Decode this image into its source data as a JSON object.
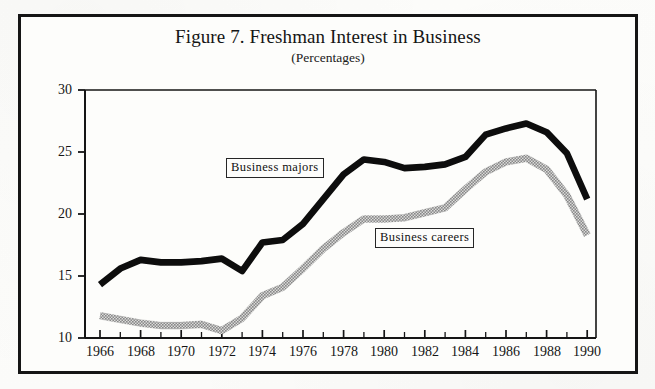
{
  "figure": {
    "title": "Figure 7. Freshman Interest in Business",
    "subtitle": "(Percentages)"
  },
  "labels": {
    "majors": "Business  majors",
    "careers": "Business  careers"
  },
  "colors": {
    "frame": "#151515",
    "axis": "#151515",
    "majors_line": "#0d0d0d",
    "careers_line": "#8a8a8a",
    "paper": "#fdfdfb"
  },
  "chart_data": {
    "type": "line",
    "title": "Figure 7. Freshman Interest in Business",
    "subtitle": "(Percentages)",
    "xlabel": "",
    "ylabel": "",
    "xlim": [
      1966,
      1990
    ],
    "ylim": [
      10,
      30
    ],
    "yticks": [
      10,
      15,
      20,
      25,
      30
    ],
    "ytick_labels": [
      "10",
      "15",
      "20",
      "25",
      "30"
    ],
    "xticks": [
      1966,
      1968,
      1970,
      1972,
      1974,
      1976,
      1978,
      1980,
      1982,
      1984,
      1986,
      1988,
      1990
    ],
    "xtick_labels": [
      "1966",
      "1968",
      "1970",
      "1972",
      "1974",
      "1976",
      "1978",
      "1980",
      "1982",
      "1984",
      "1986",
      "1988",
      "1990"
    ],
    "minor_xticks_every": 1,
    "grid": false,
    "legend": "inline-boxed-annotations",
    "x": [
      1966,
      1967,
      1968,
      1969,
      1970,
      1971,
      1972,
      1973,
      1974,
      1975,
      1976,
      1977,
      1978,
      1979,
      1980,
      1981,
      1982,
      1983,
      1984,
      1985,
      1986,
      1987,
      1988,
      1989,
      1990
    ],
    "series": [
      {
        "name": "Business majors",
        "style": "thick-solid-black",
        "values": [
          14.3,
          15.6,
          16.3,
          16.1,
          16.1,
          16.2,
          16.4,
          15.4,
          17.7,
          17.9,
          19.2,
          21.2,
          23.2,
          24.4,
          24.2,
          23.7,
          23.8,
          24.0,
          24.6,
          26.4,
          26.9,
          27.3,
          26.6,
          24.9,
          21.2
        ]
      },
      {
        "name": "Business careers",
        "style": "thick-hatched-gray",
        "values": [
          11.8,
          11.5,
          11.2,
          11.0,
          11.0,
          11.1,
          10.6,
          11.6,
          13.4,
          14.1,
          15.6,
          17.2,
          18.5,
          19.6,
          19.6,
          19.7,
          20.1,
          20.5,
          22.0,
          23.4,
          24.2,
          24.5,
          23.6,
          21.5,
          18.3
        ]
      }
    ],
    "annotations": [
      {
        "text": "Business majors",
        "x": 1973.0,
        "y": 22.3,
        "boxed": true
      },
      {
        "text": "Business careers",
        "x": 1980.5,
        "y": 17.9,
        "boxed": true
      }
    ]
  }
}
